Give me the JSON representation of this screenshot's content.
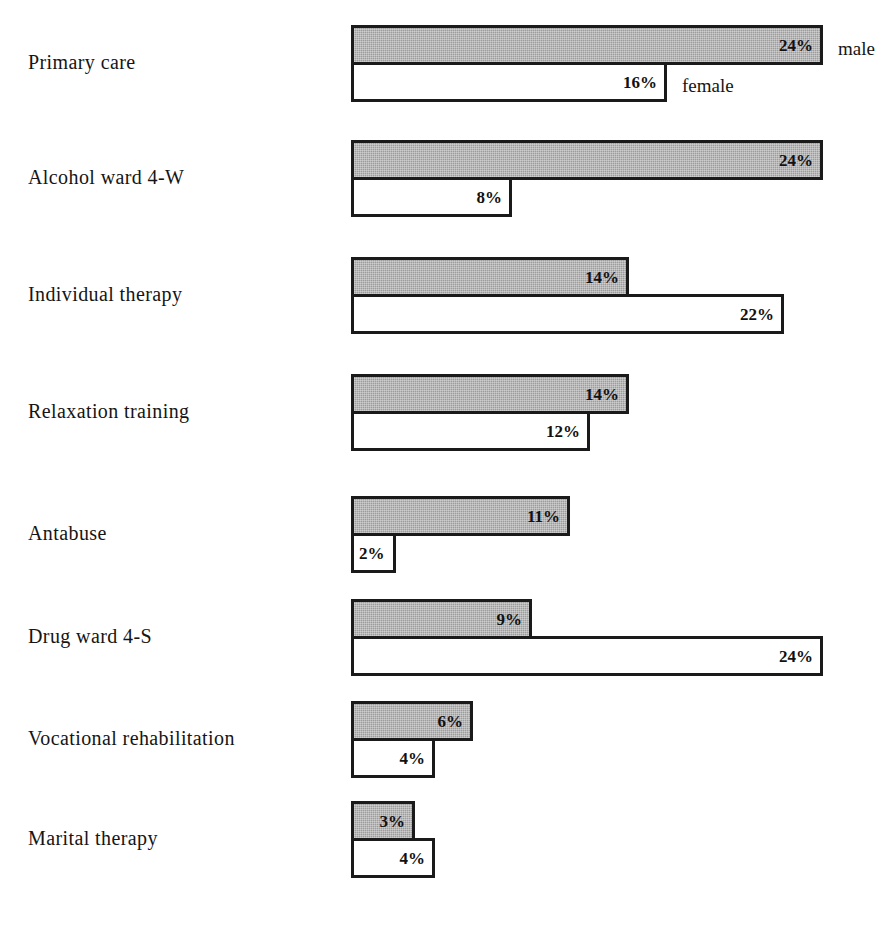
{
  "chart_data": {
    "type": "bar",
    "orientation": "horizontal",
    "title": "",
    "subtitle": "",
    "xlabel": "",
    "ylabel": "",
    "grid": false,
    "legend_position": "inline-right-of-first-group",
    "axis_range": [
      0,
      24
    ],
    "value_suffix": "%",
    "categories": [
      "Primary care",
      "Alcohol ward 4-W",
      "Individual therapy",
      "Relaxation training",
      "Antabuse",
      "Drug ward 4-S",
      "Vocational rehabilitation",
      "Marital therapy"
    ],
    "series": [
      {
        "name": "male",
        "color": "#9c9c9c",
        "values": [
          24,
          24,
          14,
          14,
          11,
          9,
          6,
          3
        ],
        "value_labels": [
          "24%",
          "24%",
          "14%",
          "14%",
          "11%",
          "9%",
          "6%",
          "3%"
        ]
      },
      {
        "name": "female",
        "color": "#ffffff",
        "values": [
          16,
          8,
          22,
          12,
          2,
          24,
          4,
          4
        ],
        "value_labels": [
          "16%",
          "8%",
          "22%",
          "12%",
          "2%",
          "24%",
          "4%",
          "4%"
        ]
      }
    ]
  },
  "legend": {
    "male_label": "male",
    "female_label": "female"
  },
  "style": {
    "bar_outline": "#1a1a1a",
    "male_fill": "#9c9c9c",
    "female_fill": "#ffffff",
    "text_color": "#151515",
    "background": "#ffffff"
  },
  "layout": {
    "bar_origin_x": 351,
    "px_per_percent": 19.4,
    "group_tops": [
      25,
      140,
      257,
      374,
      496,
      599,
      701,
      801
    ],
    "bar_height": 40
  }
}
